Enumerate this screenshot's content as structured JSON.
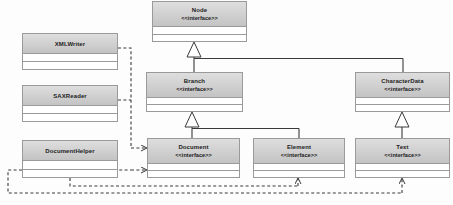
{
  "diagram": {
    "type": "uml-class-diagram",
    "stereotype_label": "<<interface>>",
    "colors": {
      "header_gradient_top": "#dedede",
      "header_gradient_bottom": "#c3c3c3",
      "box_border": "#9a9a9a",
      "box_fill": "#ffffff",
      "line": "#3a3a3a",
      "text": "#1d1d1d",
      "background": "#fdfdfd"
    },
    "classes": [
      {
        "id": "xmlwriter",
        "name": "XMLWriter",
        "stereotype": "",
        "kind": "class",
        "x": 22,
        "y": 33,
        "w": 96,
        "h": 37,
        "header_h": 17
      },
      {
        "id": "saxreader",
        "name": "SAXReader",
        "stereotype": "",
        "kind": "class",
        "x": 22,
        "y": 85,
        "w": 96,
        "h": 37,
        "header_h": 17
      },
      {
        "id": "documenthelper",
        "name": "DocumentHelper",
        "stereotype": "",
        "kind": "class",
        "x": 22,
        "y": 140,
        "w": 96,
        "h": 38,
        "header_h": 17
      },
      {
        "id": "node",
        "name": "Node",
        "stereotype": "<<interface>>",
        "kind": "interface",
        "x": 152,
        "y": 1,
        "w": 95,
        "h": 41,
        "header_h": 22
      },
      {
        "id": "branch",
        "name": "Branch",
        "stereotype": "<<interface>>",
        "kind": "interface",
        "x": 146,
        "y": 72,
        "w": 97,
        "h": 40,
        "header_h": 22
      },
      {
        "id": "characterdata",
        "name": "CharacterData",
        "stereotype": "<<interface>>",
        "kind": "interface",
        "x": 355,
        "y": 72,
        "w": 95,
        "h": 40,
        "header_h": 22
      },
      {
        "id": "document",
        "name": "Document",
        "stereotype": "<<interface>>",
        "kind": "interface",
        "x": 147,
        "y": 138,
        "w": 93,
        "h": 40,
        "header_h": 22
      },
      {
        "id": "element",
        "name": "Element",
        "stereotype": "<<interface>>",
        "kind": "interface",
        "x": 253,
        "y": 138,
        "w": 92,
        "h": 40,
        "header_h": 22
      },
      {
        "id": "text",
        "name": "Text",
        "stereotype": "<<interface>>",
        "kind": "interface",
        "x": 355,
        "y": 138,
        "w": 95,
        "h": 40,
        "header_h": 22
      }
    ],
    "relationships": [
      {
        "id": "r1",
        "type": "generalization",
        "from": "branch",
        "to": "node",
        "style": "solid",
        "arrow": "hollow-triangle"
      },
      {
        "id": "r2",
        "type": "generalization",
        "from": "characterdata",
        "to": "node",
        "style": "solid",
        "arrow": "hollow-triangle"
      },
      {
        "id": "r3",
        "type": "generalization",
        "from": "document",
        "to": "branch",
        "style": "solid",
        "arrow": "hollow-triangle"
      },
      {
        "id": "r4",
        "type": "generalization",
        "from": "element",
        "to": "branch",
        "style": "solid",
        "arrow": "hollow-triangle"
      },
      {
        "id": "r5",
        "type": "generalization",
        "from": "text",
        "to": "characterdata",
        "style": "solid",
        "arrow": "hollow-triangle"
      },
      {
        "id": "r6",
        "type": "dependency",
        "from": "xmlwriter",
        "to": "document",
        "style": "dashed",
        "arrow": "open-arrow"
      },
      {
        "id": "r7",
        "type": "dependency",
        "from": "saxreader",
        "to": "document",
        "style": "dashed",
        "arrow": "open-arrow"
      },
      {
        "id": "r8",
        "type": "dependency",
        "from": "documenthelper",
        "to": "document",
        "style": "dashed",
        "arrow": "open-arrow"
      },
      {
        "id": "r9",
        "type": "dependency",
        "from": "documenthelper",
        "to": "element",
        "style": "dashed",
        "arrow": "open-arrow"
      },
      {
        "id": "r10",
        "type": "dependency",
        "from": "documenthelper",
        "to": "text",
        "style": "dashed",
        "arrow": "open-arrow"
      }
    ]
  }
}
